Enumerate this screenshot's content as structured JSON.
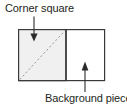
{
  "figure": {
    "name": "corner-square-diagram",
    "background_color": "#ffffff"
  },
  "labels": {
    "corner_square": "Corner square",
    "background_piece": "Background piece"
  },
  "shapes": {
    "outer_rectangle": {
      "name": "background-piece-rectangle",
      "x": 18,
      "y": 29,
      "width": 87,
      "height": 52,
      "fill": "#ffffff",
      "stroke": "#3a3a3a",
      "stroke_width": 1.2
    },
    "corner_square": {
      "name": "corner-square-region",
      "x": 18,
      "y": 29,
      "width": 48,
      "height": 52,
      "fill": "#f0f0f0",
      "stroke": "#3a3a3a",
      "stroke_width": 1.2
    },
    "divider": {
      "name": "vertical-divider",
      "x": 66,
      "y1": 29,
      "y2": 81,
      "stroke": "#3a3a3a",
      "stroke_width": 1.4
    },
    "diagonal": {
      "name": "dashed-diagonal",
      "x1": 19,
      "y1": 80,
      "x2": 65,
      "y2": 30,
      "stroke": "#9a9a9a",
      "stroke_width": 1,
      "dash": "2.2 2.2"
    }
  },
  "leaders": {
    "corner_square_arrow": {
      "name": "corner-square-leader-arrow",
      "direction": "down",
      "x": 34,
      "line_y1": 16,
      "line_y2": 34,
      "tip_y": 41,
      "stroke": "#2b2b2b"
    },
    "background_piece_arrow": {
      "name": "background-piece-leader-arrow",
      "direction": "up",
      "x": 85,
      "line_y1": 92,
      "line_y2": 70,
      "tip_y": 62,
      "stroke": "#2b2b2b"
    }
  },
  "colors": {
    "text": "#231f20",
    "line": "#3a3a3a",
    "dash": "#9a9a9a",
    "square_fill": "#f0f0f0",
    "piece_fill": "#ffffff"
  }
}
